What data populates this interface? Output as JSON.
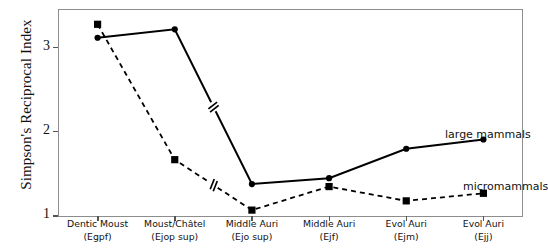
{
  "chart_data": {
    "type": "line",
    "title": "",
    "xlabel": "",
    "ylabel": "Simpson's Reciprocal Index",
    "ylim": [
      1,
      3.45
    ],
    "yticks": [
      1,
      2,
      3
    ],
    "ytick_labels": [
      "1",
      "2",
      "3"
    ],
    "grid": false,
    "legend_position": "inline-annotation",
    "categories": [
      "Dentic Moust (Egpf)",
      "Moust/Châtel (Ejop sup)",
      "Middle Auri (Ejo sup)",
      "Middle Auri (Ejf)",
      "Evol Auri (Ejm)",
      "Evol Auri (Ejj)"
    ],
    "category_lines": [
      [
        "Dentic Moust",
        "(Egpf)"
      ],
      [
        "Moust/Châtel",
        "(Ejop sup)"
      ],
      [
        "Middle Auri",
        "(Ejo sup)"
      ],
      [
        "Middle Auri",
        "(Ejf)"
      ],
      [
        "Evol Auri",
        "(Ejm)"
      ],
      [
        "Evol Auri",
        "(Ejj)"
      ]
    ],
    "series": [
      {
        "name": "large mammals",
        "marker": "circle",
        "linestyle": "solid",
        "color": "#000000",
        "values": [
          3.12,
          3.22,
          1.38,
          1.45,
          1.8,
          1.91
        ]
      },
      {
        "name": "micromammals",
        "marker": "square",
        "linestyle": "dashed",
        "color": "#000000",
        "values": [
          3.28,
          1.67,
          1.07,
          1.35,
          1.18,
          1.27
        ]
      }
    ],
    "annotations": [
      {
        "text": "large mammals",
        "series": "large mammals"
      },
      {
        "text": "micromammals",
        "series": "micromammals"
      }
    ],
    "axis_breaks": [
      {
        "series": "large mammals",
        "between": [
          2,
          3
        ]
      },
      {
        "series": "micromammals",
        "between": [
          2,
          3
        ]
      }
    ]
  },
  "axis": {
    "y_title": "Simpson's Reciprocal Index"
  }
}
